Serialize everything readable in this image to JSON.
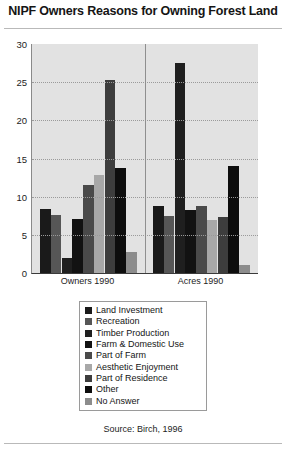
{
  "chart_data": {
    "type": "bar",
    "title": "NIPF Owners Reasons for Owning Forest Land",
    "xlabel": "",
    "ylabel": "",
    "categories": [
      "Owners 1990",
      "Acres 1990"
    ],
    "ylim": [
      0,
      30
    ],
    "yticks": [
      0,
      5,
      10,
      15,
      20,
      25,
      30
    ],
    "grid": true,
    "legend_position": "bottom",
    "source": "Source: Birch, 1996",
    "series": [
      {
        "name": "Land Investment",
        "color": "#1a1a1a",
        "values": [
          8.4,
          8.8
        ]
      },
      {
        "name": "Recreation",
        "color": "#565656",
        "values": [
          7.6,
          7.5
        ]
      },
      {
        "name": "Timber Production",
        "color": "#1f1f1f",
        "values": [
          2.0,
          27.5
        ]
      },
      {
        "name": "Farm & Domestic Use",
        "color": "#121212",
        "values": [
          7.1,
          8.3
        ]
      },
      {
        "name": "Part of Farm",
        "color": "#4a4a4a",
        "values": [
          11.5,
          8.8
        ]
      },
      {
        "name": "Aesthetic Enjoyment",
        "color": "#a8a8a8",
        "values": [
          12.8,
          7.0
        ]
      },
      {
        "name": "Part of Residence",
        "color": "#3d3d3d",
        "values": [
          25.3,
          7.3
        ]
      },
      {
        "name": "Other",
        "color": "#0d0d0d",
        "values": [
          13.8,
          14.0
        ]
      },
      {
        "name": "No Answer",
        "color": "#8c8c8c",
        "values": [
          2.7,
          1.0
        ]
      }
    ]
  }
}
